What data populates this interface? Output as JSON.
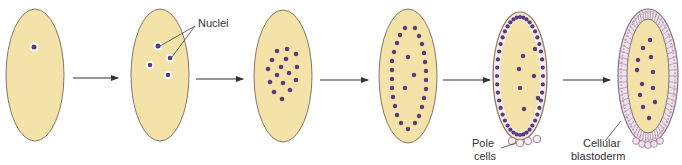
{
  "diagram": {
    "colors": {
      "background": "#ffffff",
      "yolk": "#f3e3a8",
      "outline": "#8a7466",
      "nucleus": "#5a3c7a",
      "nucleus_halo": "#ffffff",
      "arrow": "#333333",
      "cell_fill": "#f1e6ee",
      "cell_stroke": "#8a6e80"
    },
    "stages": [
      {
        "id": 1,
        "description": "Single nucleus",
        "nuclei_count": 1
      },
      {
        "id": 2,
        "description": "Nuclei dividing",
        "nuclei_count": 4
      },
      {
        "id": 3,
        "description": "Nuclei clustered",
        "nuclei_count": 16
      },
      {
        "id": 4,
        "description": "Nuclei migrate to periphery",
        "nuclei_count": 35
      },
      {
        "id": 5,
        "description": "Syncytial blastoderm with pole cells"
      },
      {
        "id": 6,
        "description": "Cellular blastoderm"
      }
    ],
    "labels": {
      "nuclei": "Nuclei",
      "pole_cells_line1": "Pole",
      "pole_cells_line2": "cells",
      "cellular_blastoderm_line1": "Cellular",
      "cellular_blastoderm_line2": "blastoderm"
    },
    "arrows": 5
  }
}
